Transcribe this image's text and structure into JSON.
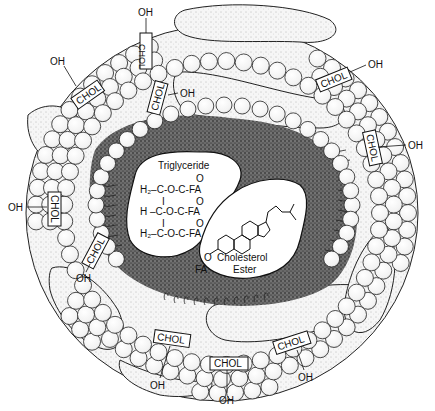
{
  "diagram": {
    "core": {
      "triglyceride": {
        "title": "Triglyceride",
        "rows": [
          {
            "left": "H₂–C-O-C-FA",
            "carbonyl": "O"
          },
          {
            "left": "H –C-O-C-FA",
            "carbonyl": "O"
          },
          {
            "left": "H₂–C-O-C-FA",
            "carbonyl": "O"
          }
        ],
        "bond": "I"
      },
      "cholesterol_ester": {
        "label_line1": "Cholesterol",
        "label_line2": "Ester",
        "ester_oxygen": "O",
        "fatty_acid": "FA"
      }
    },
    "surface_labels": [
      {
        "id": "chol-top-left",
        "chol": "CHOL",
        "oh": "OH"
      },
      {
        "id": "chol-top-vertical",
        "chol": "CHOL",
        "oh": "OH"
      },
      {
        "id": "chol-top-inner",
        "chol": "CHOL",
        "oh": "OH"
      },
      {
        "id": "chol-top-right",
        "chol": "CHOL",
        "oh": "OH"
      },
      {
        "id": "chol-right",
        "chol": "CHOL",
        "oh": "OH"
      },
      {
        "id": "chol-left",
        "chol": "CHOL",
        "oh": "OH"
      },
      {
        "id": "chol-lower-left",
        "chol": "CHOL",
        "oh": "OH"
      },
      {
        "id": "chol-bottom-left",
        "chol": "CHOL",
        "oh": "OH"
      },
      {
        "id": "chol-bottom-center",
        "chol": "CHOL",
        "oh": "OH"
      },
      {
        "id": "chol-bottom-right",
        "chol": "CHOL",
        "oh": "OH"
      }
    ],
    "colors": {
      "ink": "#111111",
      "background": "#ffffff",
      "core_stipple": "#3a3a3a"
    }
  }
}
